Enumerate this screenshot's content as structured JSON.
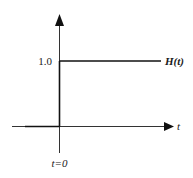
{
  "diagram": {
    "function_label": "H(t)",
    "x_axis_label": "t",
    "y_level_label": "1.0",
    "origin_label": "t=0",
    "step_value": 1.0,
    "step_at": 0
  }
}
